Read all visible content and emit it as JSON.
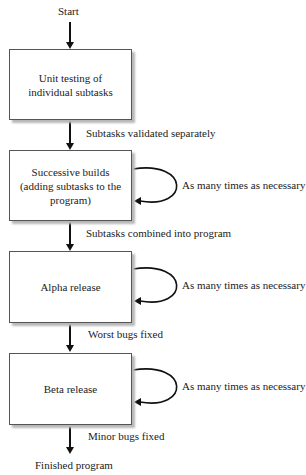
{
  "start_label": "Start",
  "end_label": "Finished program",
  "boxes": [
    {
      "label": "Unit testing of individual subtasks",
      "lines": [
        "Unit testing of",
        "individual subtasks"
      ]
    },
    {
      "label": "Successive builds (adding subtasks to the program)",
      "lines": [
        "Successive builds",
        "(adding subtasks to the",
        "program)"
      ]
    },
    {
      "label": "Alpha release",
      "lines": [
        "Alpha release"
      ]
    },
    {
      "label": "Beta release",
      "lines": [
        "Beta release"
      ]
    }
  ],
  "transitions": [
    "Subtasks validated separately",
    "Subtasks combined into program",
    "Worst bugs fixed",
    "Minor bugs fixed"
  ],
  "loop_label": "As many times as necessary"
}
